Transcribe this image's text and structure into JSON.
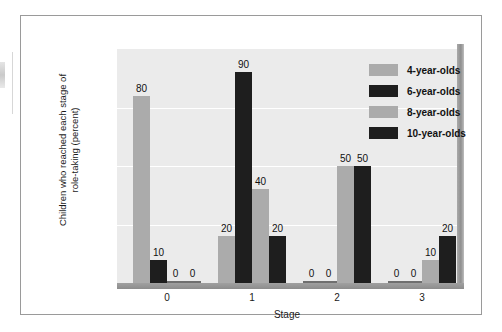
{
  "chart_data": {
    "type": "bar",
    "title": "",
    "xlabel": "Stage",
    "ylabel": "Children who reached each stage of\nrole-taking (percent)",
    "categories": [
      "0",
      "1",
      "2",
      "3"
    ],
    "yticks": [
      "0",
      "25",
      "50",
      "75",
      "100"
    ],
    "ylim": [
      0,
      100
    ],
    "grid": "horizontal-white",
    "legend_position": "top-right",
    "series": [
      {
        "name": "4-year-olds",
        "color": "#ababab",
        "values": [
          80,
          20,
          0,
          0
        ]
      },
      {
        "name": "6-year-olds",
        "color": "#1e1e1e",
        "values": [
          10,
          90,
          0,
          0
        ]
      },
      {
        "name": "8-year-olds",
        "color": "#ababab",
        "values": [
          0,
          40,
          50,
          10
        ]
      },
      {
        "name": "10-year-olds",
        "color": "#1e1e1e",
        "values": [
          0,
          20,
          50,
          20
        ]
      }
    ],
    "bar_labels": [
      [
        "80",
        "10",
        "0",
        "0"
      ],
      [
        "20",
        "90",
        "40",
        "20"
      ],
      [
        "0",
        "0",
        "50",
        "50"
      ],
      [
        "0",
        "0",
        "10",
        "20"
      ]
    ]
  },
  "colors": {
    "plot_background": "#ebebeb",
    "gridline": "#ffffff",
    "light_series": "#ababab",
    "dark_series": "#1e1e1e",
    "frame_border": "#9a9a9a",
    "floor": "#8c8c8c"
  }
}
